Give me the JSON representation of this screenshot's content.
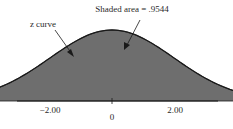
{
  "chart_data": {
    "type": "area",
    "title": "",
    "xlabel": "",
    "ylabel": "",
    "distribution": "standard normal (z curve)",
    "mean": 0,
    "sd": 1,
    "shaded_interval": [
      -2.0,
      2.0
    ],
    "shaded_area": 0.9544,
    "x_ticks": [
      -2.0,
      0,
      2.0
    ],
    "tick_labels": [
      "-2.00",
      "0",
      "2.00"
    ],
    "xlim": [
      -3.3,
      3.3
    ],
    "grid": false,
    "legend": "none",
    "annotations": [
      {
        "text": "z curve",
        "points_to": "curve"
      },
      {
        "text": "Shaded area = .9544",
        "points_to": "shaded region"
      }
    ]
  },
  "labels": {
    "z_curve": "z curve",
    "shaded_area": "Shaded area = .9544",
    "tick_neg2": "−2.00",
    "tick_0": "0",
    "tick_pos2": "2.00"
  },
  "colors": {
    "shade": "#6e6e6e",
    "curve": "#1a1a1a",
    "axis": "#1a1a1a",
    "background": "#ffffff"
  }
}
